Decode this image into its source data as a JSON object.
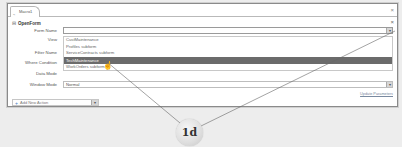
{
  "window": {
    "tab_label": "Macro1",
    "close_glyph": "×"
  },
  "section": {
    "collapse_glyph": "⊟",
    "title": "OpenForm",
    "close_glyph": "×"
  },
  "fields": {
    "form_name": {
      "label": "Form Name",
      "value": ""
    },
    "view": {
      "label": "View"
    },
    "filter_name": {
      "label": "Filter Name"
    },
    "where_condition": {
      "label": "Where Condition"
    },
    "data_mode": {
      "label": "Data Mode"
    },
    "window_mode": {
      "label": "Window Mode",
      "value": "Normal"
    }
  },
  "dropdown": {
    "items": [
      "CustMaintenance",
      "Profiles subform",
      "ServiceContracts subform",
      "TechMaintenance",
      "WorkOrders subform"
    ],
    "selected_index": 3
  },
  "update_parameters_label": "Update Parameters",
  "add_action": {
    "glyph": "+",
    "placeholder": "Add New Action"
  },
  "callout": {
    "label": "1d"
  },
  "colors": {
    "selection": "#6b6b6b",
    "link": "#7a8aa0",
    "add_icon": "#4a7ec0"
  }
}
